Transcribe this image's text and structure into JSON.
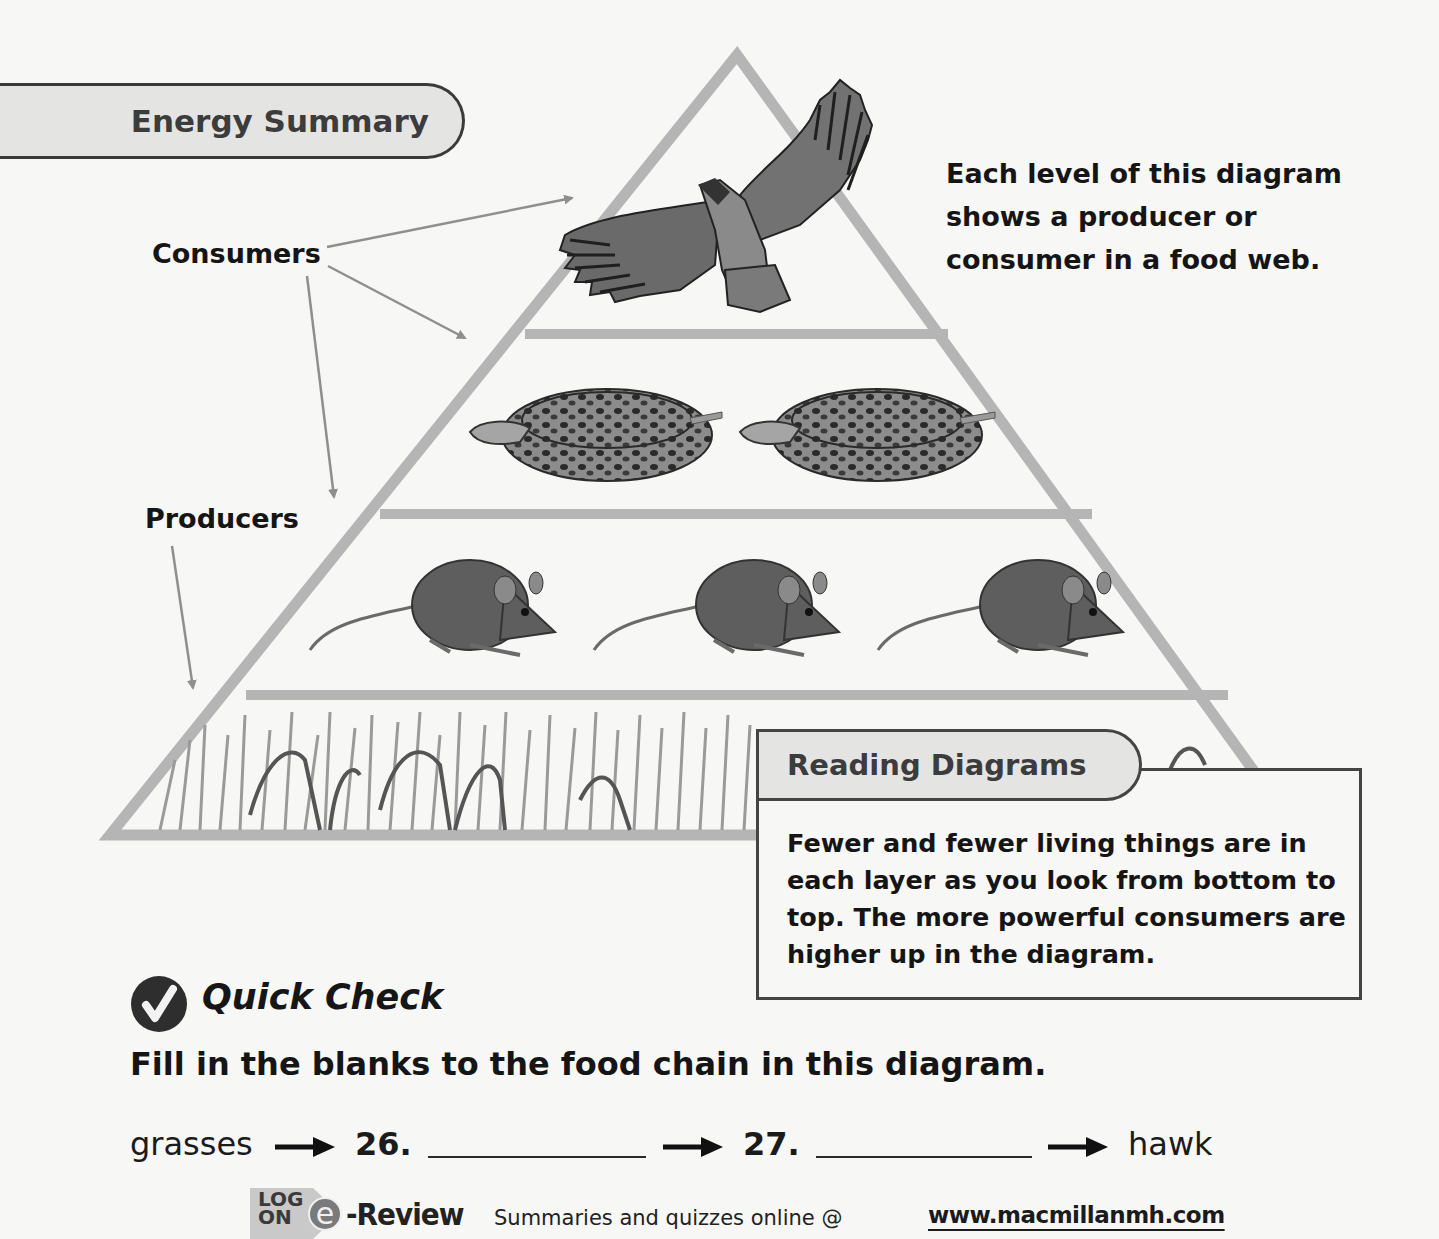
{
  "section": {
    "banner_title": "Energy Summary"
  },
  "diagram": {
    "labels": {
      "consumers": "Consumers",
      "producers": "Producers"
    },
    "intro_text": "Each level of this diagram shows a producer or consumer in a food web.",
    "levels": [
      {
        "name": "hawk",
        "count": 1,
        "role": "consumer"
      },
      {
        "name": "snake",
        "count": 2,
        "role": "consumer"
      },
      {
        "name": "mouse",
        "count": 3,
        "role": "consumer"
      },
      {
        "name": "grasses",
        "count": "many",
        "role": "producer"
      }
    ],
    "colors": {
      "pyramid_stroke": "#b5b5b5",
      "background": "#f7f7f6"
    }
  },
  "reading_diagrams": {
    "title": "Reading Diagrams",
    "body": "Fewer and fewer living things are in each layer as you look from bottom to top. The more powerful consumers are higher up in the diagram."
  },
  "quick_check": {
    "title": "Quick Check",
    "prompt": "Fill in the blanks to the food chain in this diagram.",
    "chain": {
      "start": "grasses",
      "q1_number": "26.",
      "q1_answer": "",
      "q2_number": "27.",
      "q2_answer": "",
      "end": "hawk"
    }
  },
  "footer": {
    "logon_line1": "LOG",
    "logon_line2": "ON",
    "e_glyph": "e",
    "ereview_label": "-Review",
    "summary_text": "Summaries and quizzes online @",
    "url": "www.macmillanmh.com"
  }
}
